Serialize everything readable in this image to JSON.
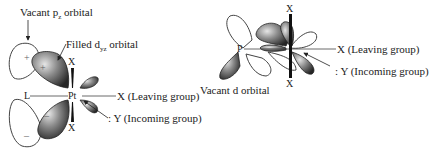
{
  "left_panel": {
    "vacant_pz_label": "Vacant p",
    "vacant_pz_sub": "z",
    "vacant_pz_suffix": " orbital",
    "filled_dyz_label": "Filled d",
    "filled_dyz_sub": "yz",
    "filled_dyz_suffix": " orbital",
    "metal": "Pt",
    "ligand_left": "L",
    "x_top": "X",
    "x_bottom": "X",
    "leaving_group": "X (Leaving group)",
    "incoming_group": ": Y (Incoming group)",
    "sign_plus_1": "+",
    "sign_plus_2": "+",
    "sign_minus_1": "–",
    "sign_minus_2": "–"
  },
  "right_panel": {
    "phosphorus": "P",
    "x_top": "X",
    "x_bottom": "X",
    "vacant_d_label": "Vacant d orbital",
    "leaving_group": "X (Leaving group)",
    "incoming_group": ": Y (Incoming group)"
  },
  "colors": {
    "filled_lobe_dark": "#2b2b2b",
    "filled_lobe_light": "#d8d8d8",
    "outline": "#444444",
    "background": "#ffffff"
  }
}
